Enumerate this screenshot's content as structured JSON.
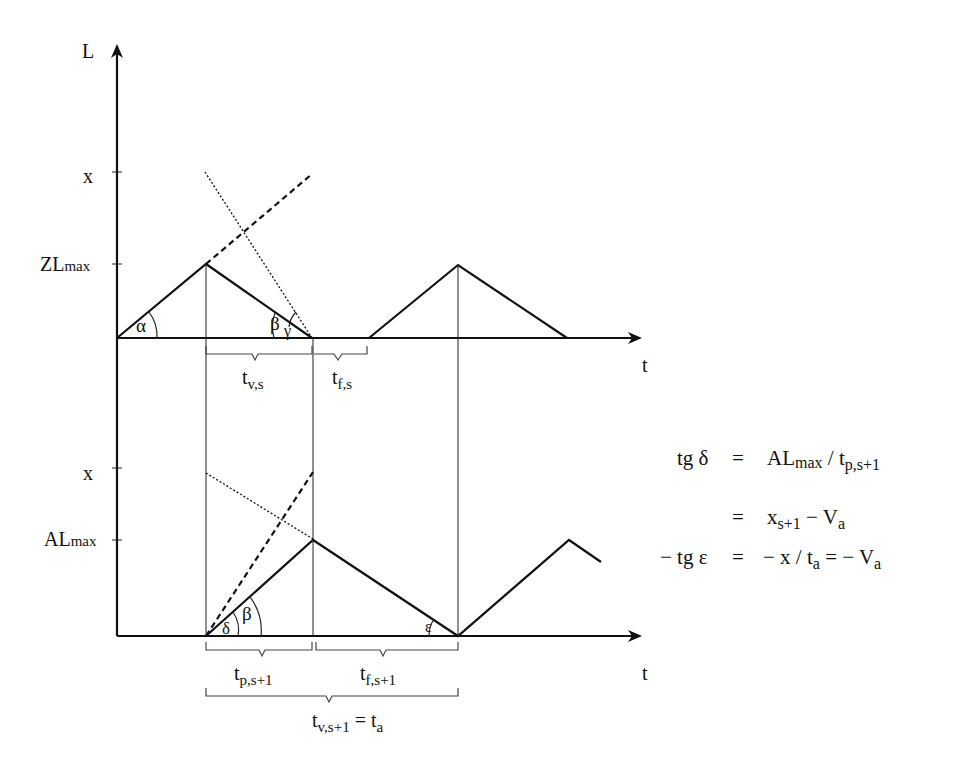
{
  "diagram": {
    "top_panel": {
      "y_axis_label": "L",
      "x_axis_label": "t",
      "tick_x_label": "x",
      "tick_max_label_main": "ZL",
      "tick_max_label_sub": "max",
      "angle_alpha": "α",
      "angle_beta": "β",
      "angle_gamma": "γ",
      "brace_tv_main": "t",
      "brace_tv_sub": "v,s",
      "brace_tf_main": "t",
      "brace_tf_sub": "f,s"
    },
    "bottom_panel": {
      "x_axis_label": "t",
      "tick_x_label": "x",
      "tick_max_label_main": "AL",
      "tick_max_label_sub": "max",
      "angle_delta": "δ",
      "angle_beta": "β",
      "angle_epsilon": "ε",
      "brace_tp_main": "t",
      "brace_tp_sub": "p,s+1",
      "brace_tf_main": "t",
      "brace_tf_sub": "f,s+1",
      "brace_total_main": "t",
      "brace_total_sub": "v,s+1",
      "brace_total_eq": " = t",
      "brace_total_eq_sub": "a"
    },
    "equations": {
      "line1_lhs": "tg δ",
      "line1_eq": "=",
      "line1_rhs_main": "AL",
      "line1_rhs_sub": "max",
      "line1_rhs_div": " / t",
      "line1_rhs_div_sub": "p,s+1",
      "line2_eq": "=",
      "line2_rhs_main": "x",
      "line2_rhs_sub": "s+1",
      "line2_rhs_tail": " − V",
      "line2_rhs_tail_sub": "a",
      "line3_lhs": "− tg ε",
      "line3_eq": "=",
      "line3_rhs_a": "− x / t",
      "line3_rhs_a_sub": "a",
      "line3_rhs_b": " =  − V",
      "line3_rhs_b_sub": "a"
    }
  }
}
